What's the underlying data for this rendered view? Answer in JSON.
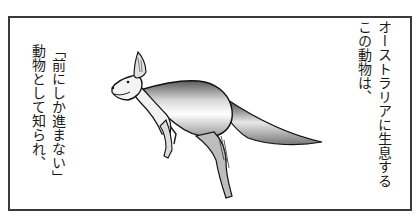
{
  "panel": {
    "border_color": "#3a3a3a",
    "illustration": "kangaroo"
  },
  "caption_right": {
    "lines": [
      "オーストラリアに生息する",
      "この動物は、"
    ]
  },
  "caption_left": {
    "lines": [
      "「前にしか進まない」",
      "動物として知られ、"
    ]
  }
}
